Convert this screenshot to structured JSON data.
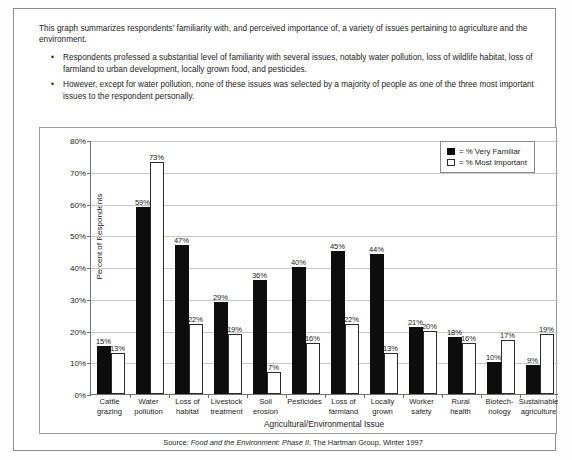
{
  "document": {
    "intro_paragraph": "This graph summarizes respondents’ familiarity with, and perceived importance of, a variety of issues pertaining to agriculture and the environment.",
    "bullets": [
      "Respondents professed a substantial level of familiarity with several issues, notably water pollution, loss of wildlife habitat, loss of farmland to urban development, locally grown food, and pesticides.",
      "However, except for water pollution, none of these issues was selected by a majority of people as one of the three most important issues to the respondent personally."
    ],
    "bullet_glyph": "•",
    "source_prefix": "Source: ",
    "source_italic": "Food and the Environment: Phase II",
    "source_suffix": ", The Hartman Group, Winter 1997"
  },
  "chart_data": {
    "type": "bar",
    "title": "",
    "xlabel": "Agricultural/Environmental Issue",
    "ylabel": "Percent of Respondents",
    "ylim": [
      0,
      80
    ],
    "ytick_labels": [
      "0%",
      "10%",
      "20%",
      "30%",
      "40%",
      "50%",
      "60%",
      "70%",
      "80%"
    ],
    "ytick_values": [
      0,
      10,
      20,
      30,
      40,
      50,
      60,
      70,
      80
    ],
    "grid": true,
    "legend_position": "top-right",
    "categories": [
      "Cattle\ngrazing",
      "Water\npollution",
      "Loss of\nhabitat",
      "Livestock\ntreatment",
      "Soil\nerosion",
      "Pesticides",
      "Loss of\nfarmland",
      "Locally\ngrown",
      "Worker\nsafety",
      "Rural\nhealth",
      "Biotech-\nnology",
      "Sustainable\nagriculture"
    ],
    "series": [
      {
        "name": "% Very Familiar",
        "color": "#0d0d0d",
        "style": "filled",
        "values": [
          15,
          59,
          47,
          29,
          36,
          40,
          45,
          44,
          21,
          18,
          10,
          9
        ],
        "labels": [
          "15%",
          "59%",
          "47%",
          "29%",
          "36%",
          "40%",
          "45%",
          "44%",
          "21%",
          "18%",
          "10%",
          "9%"
        ]
      },
      {
        "name": "% Most Important",
        "color": "#ffffff",
        "style": "hollow",
        "values": [
          13,
          73,
          22,
          19,
          7,
          16,
          22,
          13,
          20,
          16,
          17,
          19
        ],
        "labels": [
          "13%",
          "73%",
          "22%",
          "19%",
          "7%",
          "16%",
          "22%",
          "13%",
          "20%",
          "16%",
          "17%",
          "19%"
        ]
      }
    ]
  },
  "legend": {
    "items": [
      {
        "prefix": "= % Very Familiar",
        "swatch": "filled"
      },
      {
        "prefix": "= % Most Important",
        "swatch": "hollow"
      }
    ]
  }
}
